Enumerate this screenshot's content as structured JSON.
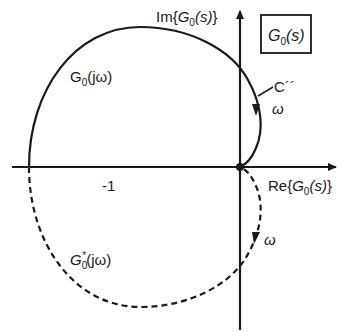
{
  "diagram": {
    "type": "nyquist-plot",
    "colors": {
      "ink": "#1a1a1a",
      "background": "#ffffff"
    },
    "axes": {
      "imag": {
        "prefix": "Im{",
        "G": "G",
        "sub": "0",
        "arg": "(s)",
        "suffix": "}"
      },
      "real": {
        "prefix": "Re{",
        "G": "G",
        "sub": "0",
        "arg": "(s)",
        "suffix": "}"
      }
    },
    "box_label": {
      "G": "G",
      "sub": "0",
      "arg": "(s)"
    },
    "curves": {
      "solid": {
        "G": "G",
        "sub": "0",
        "arg": "(jω)",
        "style": "solid"
      },
      "dashed": {
        "G": "G",
        "sub": "0",
        "sup": "*",
        "arg": "(jω)",
        "style": "dashed"
      }
    },
    "contour_label": "C´´",
    "omega_upper": "ω",
    "omega_lower": "ω",
    "critical_point": "-1"
  }
}
